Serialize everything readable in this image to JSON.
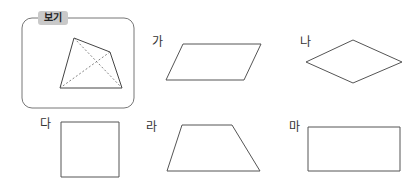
{
  "example_box": {
    "label": "보기",
    "shape": "quadrilateral with dashed diagonals",
    "vertices": [
      [
        74,
        38
      ],
      [
        110,
        52
      ],
      [
        122,
        88
      ],
      [
        60,
        88
      ]
    ]
  },
  "shapes": [
    {
      "label": "가",
      "type": "parallelogram",
      "points": "183,44 261,44 244,80 166,80"
    },
    {
      "label": "나",
      "type": "rhombus",
      "points": "353,40 402,62 353,83 306,62"
    },
    {
      "label": "다",
      "type": "square",
      "points": "61,122 119,122 119,177 61,177"
    },
    {
      "label": "라",
      "type": "trapezoid",
      "points": "182,125 232,125 260,171 167,171"
    },
    {
      "label": "마",
      "type": "rectangle",
      "points": "308,127 400,127 400,171 308,171"
    }
  ],
  "colors": {
    "stroke": "#555555",
    "box_border": "#777777",
    "pill_bg": "#c9c9c9"
  }
}
